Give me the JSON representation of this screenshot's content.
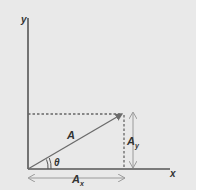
{
  "diagram": {
    "labels": {
      "y_axis": "y",
      "x_axis": "x",
      "vector": "A",
      "angle": "θ",
      "x_component": "A",
      "x_component_sub": "x",
      "y_component": "A",
      "y_component_sub": "y"
    },
    "colors": {
      "background": "#e9e9e9",
      "axes": "#555555",
      "vector": "#6b6b6b",
      "dashed": "#666666",
      "arrows": "#9a9a9a",
      "text": "#333333"
    }
  }
}
